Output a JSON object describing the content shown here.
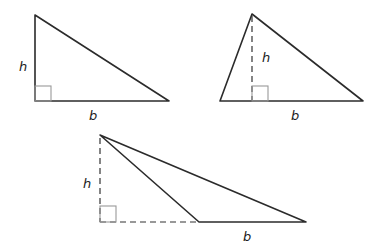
{
  "colors": {
    "edge": "#2b2b2b",
    "dashed": "#333333",
    "right_angle_marker": "#999999",
    "background": "#ffffff"
  },
  "triangles": [
    {
      "name": "right-triangle",
      "height_label": "h",
      "base_label": "b",
      "vertices": [
        [
          35,
          15
        ],
        [
          35,
          101
        ],
        [
          169,
          101
        ]
      ],
      "height_style": "solid-leg",
      "right_angle_box": [
        35,
        86,
        16,
        15
      ]
    },
    {
      "name": "acute-triangle",
      "height_label": "h",
      "base_label": "b",
      "vertices": [
        [
          252,
          14
        ],
        [
          220,
          101
        ],
        [
          363,
          101
        ]
      ],
      "height_style": "dashed-interior",
      "right_angle_box": [
        252,
        86,
        16,
        15
      ]
    },
    {
      "name": "obtuse-triangle",
      "height_label": "h",
      "base_label": "b",
      "vertices": [
        [
          100,
          135
        ],
        [
          199,
          222
        ],
        [
          306,
          222
        ]
      ],
      "height_style": "dashed-exterior",
      "right_angle_box": [
        100,
        206,
        16,
        16
      ]
    }
  ]
}
